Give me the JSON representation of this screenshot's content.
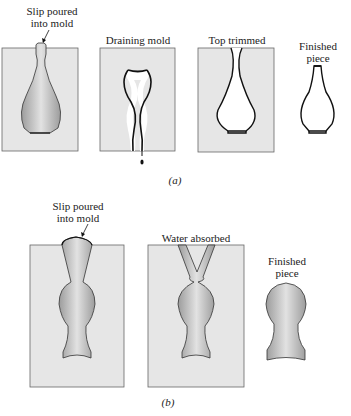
{
  "figure": {
    "colors": {
      "mold": "#e6e6e6",
      "mold_border": "#555555",
      "slip_light": "#d9d9d9",
      "slip_dark": "#9a9a9a",
      "outline": "#111111"
    },
    "part_a": {
      "caption": "(a)",
      "stages": [
        {
          "label_line1": "Slip poured",
          "label_line2": "into mold"
        },
        {
          "label": "Draining mold"
        },
        {
          "label": "Top trimmed"
        },
        {
          "label_line1": "Finished",
          "label_line2": "piece"
        }
      ]
    },
    "part_b": {
      "caption": "(b)",
      "stages": [
        {
          "label_line1": "Slip poured",
          "label_line2": "into mold"
        },
        {
          "label": "Water absorbed"
        },
        {
          "label_line1": "Finished",
          "label_line2": "piece"
        }
      ]
    }
  }
}
